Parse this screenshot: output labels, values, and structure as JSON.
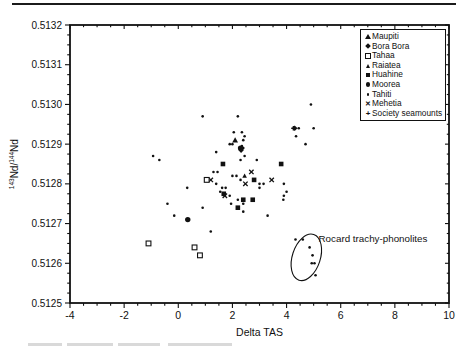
{
  "figure": {
    "y_axis_title": {
      "sup1": "143",
      "mid": "Nd/",
      "sup2": "144",
      "end": "Nd"
    },
    "x_axis_title": "Delta TAS"
  },
  "chart_data": {
    "type": "scatter",
    "title": "",
    "xlabel": "Delta TAS",
    "ylabel": "143Nd/144Nd",
    "xlim": [
      -4,
      10
    ],
    "ylim": [
      0.5125,
      0.5132
    ],
    "x_major_ticks": [
      -4,
      -2,
      0,
      2,
      4,
      6,
      8,
      10
    ],
    "x_tick_labels": [
      "-4",
      "-2",
      "0",
      "2",
      "4",
      "6",
      "8",
      "10"
    ],
    "x_minor_step": 0.5,
    "y_major_ticks": [
      0.5125,
      0.5126,
      0.5127,
      0.5128,
      0.5129,
      0.513,
      0.5131,
      0.5132
    ],
    "y_tick_labels": [
      "0.5125",
      "0.5126",
      "0.5127",
      "0.5128",
      "0.5129",
      "0.5130",
      "0.5131",
      "0.5132"
    ],
    "y_minor_step": 2.5e-05,
    "grid": false,
    "legend": {
      "position": "top-right",
      "entries": [
        {
          "label": "Maupiti",
          "marker": "filled-triangle"
        },
        {
          "label": "Bora Bora",
          "marker": "filled-diamond"
        },
        {
          "label": "Tahaa",
          "marker": "open-square"
        },
        {
          "label": "Raiatea",
          "marker": "small-triangle"
        },
        {
          "label": "Huahine",
          "marker": "filled-square"
        },
        {
          "label": "Moorea",
          "marker": "filled-circle"
        },
        {
          "label": "Tahiti",
          "marker": "dot"
        },
        {
          "label": "Mehetia",
          "marker": "x"
        },
        {
          "label": "Society seamounts",
          "marker": "plus"
        }
      ]
    },
    "annotation": {
      "text": "Rocard trachy-phonolites",
      "text_anchor": {
        "x": 5.18,
        "y": 0.51266
      },
      "ellipse": {
        "cx": 4.73,
        "cy": 0.512615,
        "rx_px": 14,
        "ry_px": 24,
        "rotation_deg": 18
      }
    },
    "points": [
      {
        "m": "dot",
        "x": 0.9,
        "y": 0.51297
      },
      {
        "m": "dot",
        "x": 2.2,
        "y": 0.51297
      },
      {
        "m": "dot",
        "x": 4.9,
        "y": 0.513
      },
      {
        "m": "dot",
        "x": 2.05,
        "y": 0.51293
      },
      {
        "m": "dot",
        "x": 2.35,
        "y": 0.51293
      },
      {
        "m": "dot",
        "x": 2.45,
        "y": 0.51292
      },
      {
        "m": "dot",
        "x": 2.0,
        "y": 0.5129
      },
      {
        "m": "dot",
        "x": 2.4,
        "y": 0.51291
      },
      {
        "m": "dot",
        "x": 1.9,
        "y": 0.5129
      },
      {
        "m": "plus",
        "x": 4.25,
        "y": 0.51294
      },
      {
        "m": "dot",
        "x": 4.45,
        "y": 0.51294
      },
      {
        "m": "dot",
        "x": 5.0,
        "y": 0.51294
      },
      {
        "m": "dot",
        "x": 4.35,
        "y": 0.51292
      },
      {
        "m": "dot",
        "x": 4.7,
        "y": 0.5129
      },
      {
        "m": "dot",
        "x": -0.93,
        "y": 0.51287
      },
      {
        "m": "dot",
        "x": -0.7,
        "y": 0.51286
      },
      {
        "m": "dot",
        "x": 1.4,
        "y": 0.51288
      },
      {
        "m": "dot",
        "x": 2.4,
        "y": 0.51289
      },
      {
        "m": "dot",
        "x": 2.45,
        "y": 0.51287
      },
      {
        "m": "dot",
        "x": 2.9,
        "y": 0.51286
      },
      {
        "m": "dot",
        "x": 2.3,
        "y": 0.51286
      },
      {
        "m": "dot",
        "x": 1.3,
        "y": 0.51283
      },
      {
        "m": "dot",
        "x": 1.45,
        "y": 0.51283
      },
      {
        "m": "dot",
        "x": 2.0,
        "y": 0.51282
      },
      {
        "m": "dot",
        "x": 2.15,
        "y": 0.51282
      },
      {
        "m": "dot",
        "x": 2.3,
        "y": 0.51281
      },
      {
        "m": "dot",
        "x": 3.0,
        "y": 0.5128
      },
      {
        "m": "dot",
        "x": 3.15,
        "y": 0.5128
      },
      {
        "m": "dot",
        "x": 1.4,
        "y": 0.5128
      },
      {
        "m": "dot",
        "x": 1.55,
        "y": 0.51278
      },
      {
        "m": "dot",
        "x": 1.62,
        "y": 0.51279
      },
      {
        "m": "dot",
        "x": 1.75,
        "y": 0.51279
      },
      {
        "m": "dot",
        "x": 1.9,
        "y": 0.51277
      },
      {
        "m": "dot",
        "x": 2.2,
        "y": 0.51276
      },
      {
        "m": "dot",
        "x": 2.4,
        "y": 0.51275
      },
      {
        "m": "dot",
        "x": 1.95,
        "y": 0.51275
      },
      {
        "m": "dot",
        "x": 3.0,
        "y": 0.51279
      },
      {
        "m": "dot",
        "x": 3.9,
        "y": 0.5128
      },
      {
        "m": "dot",
        "x": 4.0,
        "y": 0.51278
      },
      {
        "m": "dot",
        "x": 3.9,
        "y": 0.51277
      },
      {
        "m": "dot",
        "x": 3.88,
        "y": 0.51276
      },
      {
        "m": "dot",
        "x": 3.3,
        "y": 0.51272
      },
      {
        "m": "dot",
        "x": 2.4,
        "y": 0.51273
      },
      {
        "m": "dot",
        "x": 0.33,
        "y": 0.51279
      },
      {
        "m": "dot",
        "x": -0.4,
        "y": 0.51275
      },
      {
        "m": "dot",
        "x": -0.15,
        "y": 0.51272
      },
      {
        "m": "dot",
        "x": 0.9,
        "y": 0.51274
      },
      {
        "m": "dot",
        "x": 1.2,
        "y": 0.51268
      },
      {
        "m": "dot",
        "x": 2.35,
        "y": 0.512895
      },
      {
        "m": "dot",
        "x": 4.33,
        "y": 0.51266
      },
      {
        "m": "dot",
        "x": 4.6,
        "y": 0.51266
      },
      {
        "m": "dot",
        "x": 4.85,
        "y": 0.51264
      },
      {
        "m": "dot",
        "x": 4.96,
        "y": 0.51262
      },
      {
        "m": "dot",
        "x": 4.93,
        "y": 0.5126
      },
      {
        "m": "dot",
        "x": 5.03,
        "y": 0.5126
      },
      {
        "m": "dot",
        "x": 5.07,
        "y": 0.51257
      },
      {
        "m": "x",
        "x": 3.45,
        "y": 0.51281
      },
      {
        "m": "x",
        "x": 2.48,
        "y": 0.5128
      },
      {
        "m": "x",
        "x": 1.2,
        "y": 0.51281
      },
      {
        "m": "x",
        "x": 1.72,
        "y": 0.51277
      },
      {
        "m": "x",
        "x": 2.7,
        "y": 0.51283
      },
      {
        "m": "filled-square",
        "x": 1.65,
        "y": 0.51285
      },
      {
        "m": "filled-square",
        "x": 3.8,
        "y": 0.51285
      },
      {
        "m": "filled-square",
        "x": 2.8,
        "y": 0.51281
      },
      {
        "m": "filled-square",
        "x": 2.4,
        "y": 0.51276
      },
      {
        "m": "filled-square",
        "x": 2.75,
        "y": 0.51276
      },
      {
        "m": "filled-square",
        "x": 2.2,
        "y": 0.51274
      },
      {
        "m": "filled-square",
        "x": 1.68,
        "y": 0.512775
      },
      {
        "m": "filled-circle",
        "x": 0.35,
        "y": 0.51271
      },
      {
        "m": "filled-circle",
        "x": 2.3,
        "y": 0.51289
      },
      {
        "m": "filled-diamond",
        "x": 2.32,
        "y": 0.512885
      },
      {
        "m": "filled-diamond",
        "x": 4.3,
        "y": 0.51294
      },
      {
        "m": "filled-triangle",
        "x": 2.1,
        "y": 0.51291
      },
      {
        "m": "small-triangle",
        "x": 2.45,
        "y": 0.51282
      },
      {
        "m": "open-square",
        "x": -1.1,
        "y": 0.51265
      },
      {
        "m": "open-square",
        "x": 0.6,
        "y": 0.51264
      },
      {
        "m": "open-square",
        "x": 0.8,
        "y": 0.51262
      },
      {
        "m": "open-square",
        "x": 1.05,
        "y": 0.51281
      }
    ]
  }
}
